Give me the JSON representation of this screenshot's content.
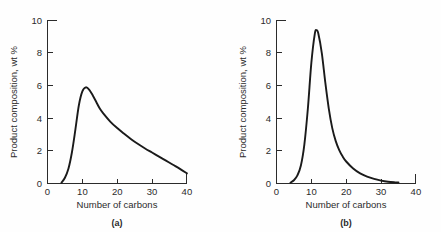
{
  "figure": {
    "background_color": "#fefefe",
    "curve_color": "#1a1a1a",
    "axis_color": "#2b2b2b"
  },
  "chart_data": [
    {
      "type": "line",
      "panel_label": "(a)",
      "title": "",
      "xlabel": "Number of carbons",
      "ylabel": "Product composition, wt %",
      "xlim": [
        0,
        40
      ],
      "ylim": [
        0,
        10
      ],
      "xticks": [
        0,
        10,
        20,
        30,
        40
      ],
      "yticks": [
        0,
        2,
        4,
        6,
        8,
        10
      ],
      "xtick_labels": [
        "0",
        "10",
        "20",
        "30",
        "40"
      ],
      "ytick_labels": [
        "0",
        "2",
        "4",
        "6",
        "8",
        "10"
      ],
      "grid": false,
      "legend": false,
      "x": [
        4,
        5,
        6,
        7,
        8,
        9,
        10,
        11,
        12,
        13,
        14,
        15,
        16,
        18,
        20,
        22,
        24,
        26,
        28,
        30,
        32,
        34,
        36,
        38,
        40
      ],
      "values": [
        0.05,
        0.35,
        0.9,
        1.9,
        3.3,
        4.8,
        5.65,
        5.9,
        5.75,
        5.4,
        5.0,
        4.6,
        4.3,
        3.8,
        3.4,
        3.05,
        2.72,
        2.42,
        2.15,
        1.9,
        1.65,
        1.4,
        1.15,
        0.9,
        0.62
      ]
    },
    {
      "type": "line",
      "panel_label": "(b)",
      "title": "",
      "xlabel": "Number of carbons",
      "ylabel": "Product composition, wt %",
      "xlim": [
        0,
        40
      ],
      "ylim": [
        0,
        10
      ],
      "xticks": [
        0,
        10,
        20,
        30,
        40
      ],
      "yticks": [
        0,
        2,
        4,
        6,
        8,
        10
      ],
      "xtick_labels": [
        "0",
        "10",
        "20",
        "30",
        "40"
      ],
      "ytick_labels": [
        "0",
        "2",
        "4",
        "6",
        "8",
        "10"
      ],
      "grid": false,
      "legend": false,
      "x": [
        4,
        5,
        6,
        7,
        8,
        9,
        10,
        11,
        11.5,
        12,
        13,
        14,
        15,
        16,
        17,
        18,
        19,
        20,
        22,
        24,
        26,
        28,
        30,
        32,
        34,
        35
      ],
      "values": [
        0.05,
        0.2,
        0.5,
        1.1,
        2.4,
        4.6,
        7.4,
        9.2,
        9.4,
        9.2,
        8.0,
        6.2,
        4.6,
        3.4,
        2.6,
        2.05,
        1.65,
        1.35,
        0.92,
        0.62,
        0.42,
        0.28,
        0.18,
        0.11,
        0.07,
        0.06
      ]
    }
  ]
}
